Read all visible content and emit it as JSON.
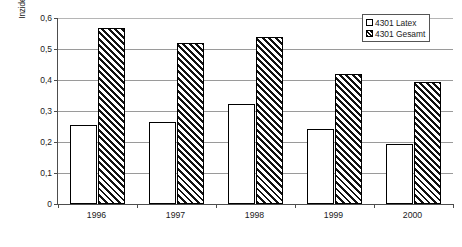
{
  "chart_data": {
    "type": "bar",
    "title": "",
    "subtitle": "",
    "xlabel": "",
    "ylabel": "Inzidenz der BK-Verdachtsfälle je 1.000 Versicherte",
    "categories": [
      "1996",
      "1997",
      "1998",
      "1999",
      "2000"
    ],
    "series": [
      {
        "name": "4301 Latex",
        "values": [
          0.256,
          0.265,
          0.323,
          0.242,
          0.194
        ],
        "fill": "dotted",
        "color": "#ffffff"
      },
      {
        "name": "4301 Gesamt",
        "values": [
          0.569,
          0.52,
          0.54,
          0.418,
          0.393
        ],
        "fill": "diagonal-hatch",
        "color": "#111111"
      }
    ],
    "ylim": [
      0,
      0.6
    ],
    "ytick_values": [
      0,
      0.1,
      0.2,
      0.3,
      0.4,
      0.5,
      0.6
    ],
    "ytick_labels": [
      "0",
      "0,1",
      "0,2",
      "0,3",
      "0,4",
      "0,5",
      "0,6"
    ],
    "grid": true,
    "grid_axis": "y",
    "legend_position": "top-right",
    "legend_entries": [
      "4301 Latex",
      "4301 Gesamt"
    ],
    "annotations": []
  },
  "axes": {
    "y_title": "Inzidenz der BK-Verdachtsfälle je 1.000 Versicherte",
    "y_ticks": [
      {
        "label": "0,6",
        "value": 0.6
      },
      {
        "label": "0,5",
        "value": 0.5
      },
      {
        "label": "0,4",
        "value": 0.4
      },
      {
        "label": "0,3",
        "value": 0.3
      },
      {
        "label": "0,2",
        "value": 0.2
      },
      {
        "label": "0,1",
        "value": 0.1
      },
      {
        "label": "0",
        "value": 0
      }
    ],
    "x_ticks": [
      {
        "label": "1996"
      },
      {
        "label": "1997"
      },
      {
        "label": "1998"
      },
      {
        "label": "1999"
      },
      {
        "label": "2000"
      }
    ]
  },
  "legend": {
    "items": [
      {
        "label": "4301 Latex",
        "swatch": "dotted-swatch"
      },
      {
        "label": "4301 Gesamt",
        "swatch": "hatched-swatch"
      }
    ]
  },
  "style": {
    "axis_color": "#4d4d4d",
    "grid_color": "#9a9a9a",
    "bar_outline": "#000000",
    "background": "#ffffff"
  }
}
